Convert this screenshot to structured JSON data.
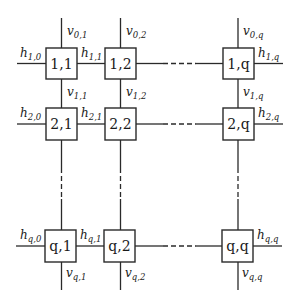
{
  "diagram": {
    "type": "grid-network",
    "nodes": {
      "n11": "1,1",
      "n12": "1,2",
      "n1q": "1,q",
      "n21": "2,1",
      "n22": "2,2",
      "n2q": "2,q",
      "nq1": "q,1",
      "nq2": "q,2",
      "nqq": "q,q"
    },
    "labels": {
      "v01": {
        "base": "v",
        "sub": "0,1"
      },
      "v02": {
        "base": "v",
        "sub": "0,2"
      },
      "v0q": {
        "base": "v",
        "sub": "0,q"
      },
      "h10": {
        "base": "h",
        "sub": "1,0"
      },
      "h11": {
        "base": "h",
        "sub": "1,1"
      },
      "h1q": {
        "base": "h",
        "sub": "1,q"
      },
      "v11": {
        "base": "v",
        "sub": "1,1"
      },
      "v12": {
        "base": "v",
        "sub": "1,2"
      },
      "v1q": {
        "base": "v",
        "sub": "1,q"
      },
      "h20": {
        "base": "h",
        "sub": "2,0"
      },
      "h21": {
        "base": "h",
        "sub": "2,1"
      },
      "h2q": {
        "base": "h",
        "sub": "2,q"
      },
      "hq0": {
        "base": "h",
        "sub": "q,0"
      },
      "hq1": {
        "base": "h",
        "sub": "q,1"
      },
      "hqq": {
        "base": "h",
        "sub": "q,q"
      },
      "vq1": {
        "base": "v",
        "sub": "q,1"
      },
      "vq2": {
        "base": "v",
        "sub": "q,2"
      },
      "vqq": {
        "base": "v",
        "sub": "q,q"
      }
    }
  }
}
